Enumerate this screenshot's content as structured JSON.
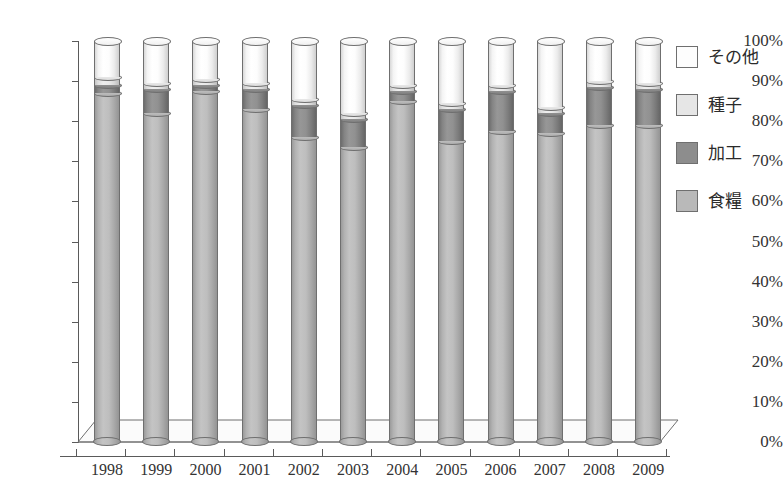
{
  "chart_data": {
    "type": "bar",
    "title": "",
    "subtitle": "",
    "xlabel": "",
    "ylabel": "",
    "stacked": true,
    "stack_mode": "percent",
    "grid": false,
    "legend_position": "right",
    "ylim": [
      0,
      100
    ],
    "yticks": [
      0,
      10,
      20,
      30,
      40,
      50,
      60,
      70,
      80,
      90,
      100
    ],
    "ytick_labels": [
      "0%",
      "10%",
      "20%",
      "30%",
      "40%",
      "50%",
      "60%",
      "70%",
      "80%",
      "90%",
      "100%"
    ],
    "categories": [
      "1998",
      "1999",
      "2000",
      "2001",
      "2002",
      "2003",
      "2004",
      "2005",
      "2006",
      "2007",
      "2008",
      "2009"
    ],
    "series": [
      {
        "name": "食糧",
        "key": "food",
        "color": "#b9b9b9",
        "values": [
          87.0,
          82.0,
          87.5,
          83.0,
          76.0,
          73.5,
          85.0,
          75.0,
          77.5,
          77.0,
          79.0,
          79.0
        ]
      },
      {
        "name": "加工",
        "key": "processing",
        "color": "#8d8d8d",
        "values": [
          2.0,
          6.0,
          1.5,
          5.0,
          8.0,
          7.0,
          2.5,
          8.0,
          10.0,
          5.0,
          9.5,
          9.0
        ]
      },
      {
        "name": "種子",
        "key": "seed",
        "color": "#e6e6e6",
        "values": [
          2.0,
          1.5,
          1.5,
          1.5,
          1.5,
          1.5,
          1.5,
          1.5,
          1.5,
          1.5,
          1.5,
          1.5
        ]
      },
      {
        "name": "その他",
        "key": "other",
        "color": "#fdfdfd",
        "values": [
          9.0,
          10.5,
          9.5,
          10.5,
          14.5,
          18.0,
          11.0,
          15.5,
          11.0,
          16.5,
          10.0,
          10.5
        ]
      }
    ]
  },
  "legend": {
    "items": [
      {
        "label": "その他",
        "swatch_class": "sw-other",
        "icon": "legend-swatch-other"
      },
      {
        "label": "種子",
        "swatch_class": "sw-seed",
        "icon": "legend-swatch-seed"
      },
      {
        "label": "加工",
        "swatch_class": "sw-proc",
        "icon": "legend-swatch-processing"
      },
      {
        "label": "食糧",
        "swatch_class": "sw-food",
        "icon": "legend-swatch-food"
      }
    ]
  },
  "caption": {
    "partial_text": ""
  }
}
